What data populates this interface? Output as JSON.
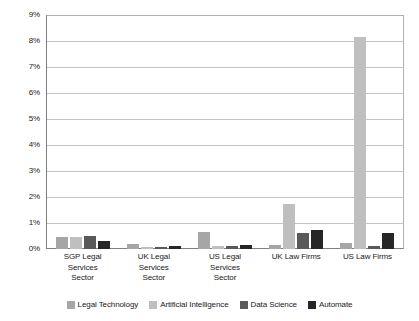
{
  "chart_data": {
    "type": "bar",
    "title": "",
    "subtitle": "",
    "xlabel": "",
    "ylabel": "",
    "ylim": [
      0,
      9
    ],
    "ytick_step": 1,
    "ytick_labels": [
      "0%",
      "1%",
      "2%",
      "3%",
      "4%",
      "5%",
      "6%",
      "7%",
      "8%",
      "9%"
    ],
    "grid": true,
    "grid_axis": "y",
    "legend_position": "bottom",
    "value_unit": "%",
    "categories": [
      "SGP Legal Services Sector",
      "UK Legal Services Sector",
      "US Legal Services Sector",
      "UK Law Firms",
      "US Law Firms"
    ],
    "category_lines": [
      [
        "SGP Legal",
        "Services",
        "Sector"
      ],
      [
        "UK Legal",
        "Services",
        "Sector"
      ],
      [
        "US Legal",
        "Services",
        "Sector"
      ],
      [
        "UK Law Firms"
      ],
      [
        "US Law Firms"
      ]
    ],
    "series": [
      {
        "name": "Legal Technology",
        "color": "#a6a6a6",
        "values": [
          0.45,
          0.2,
          0.65,
          0.15,
          0.25
        ]
      },
      {
        "name": "Artificial Intelligence",
        "color": "#bfbfbf",
        "values": [
          0.45,
          0.08,
          0.1,
          1.75,
          8.15
        ]
      },
      {
        "name": "Data Science",
        "color": "#595959",
        "values": [
          0.5,
          0.08,
          0.1,
          0.6,
          0.1
        ]
      },
      {
        "name": "Automate",
        "color": "#262626",
        "values": [
          0.3,
          0.1,
          0.15,
          0.75,
          0.6
        ]
      }
    ]
  },
  "style": {
    "plot_background": "#ffffff",
    "gridline_color": "#c4c4c4",
    "axis_color": "#808080",
    "text_color": "#1a1a1a"
  }
}
